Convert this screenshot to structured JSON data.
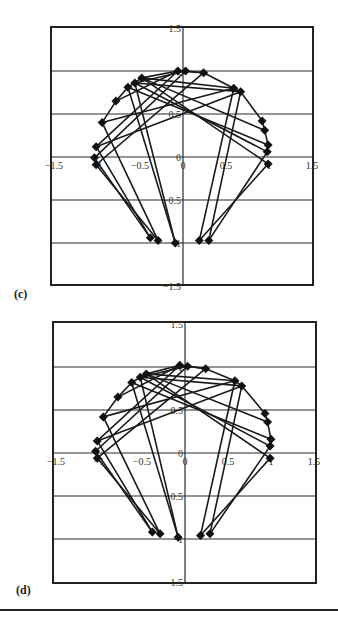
{
  "chart_data": [
    {
      "type": "scatter",
      "panel_label": "(c)",
      "title": "",
      "xlabel": "",
      "ylabel": "",
      "xlim": [
        -1.5,
        1.5
      ],
      "ylim": [
        -1.5,
        1.5
      ],
      "x_ticks": [
        "-1.5",
        "-1",
        "-0.5",
        "0",
        "0.5",
        "1",
        "1.5"
      ],
      "y_ticks": [
        "1.5",
        "1",
        "0.5",
        "0",
        "-0.5",
        "-1",
        "-1.5"
      ],
      "grid": "horizontal",
      "marker": "diamond",
      "line_color": "#1a1a1a",
      "nodes": [
        [
          -0.06,
          1.0
        ],
        [
          0.03,
          1.0
        ],
        [
          0.24,
          0.98
        ],
        [
          -0.48,
          0.92
        ],
        [
          -0.56,
          0.86
        ],
        [
          -0.64,
          0.81
        ],
        [
          -0.78,
          0.65
        ],
        [
          -0.94,
          0.4
        ],
        [
          -1.01,
          0.12
        ],
        [
          -1.03,
          -0.01
        ],
        [
          -1.01,
          -0.09
        ],
        [
          0.59,
          0.8
        ],
        [
          0.67,
          0.76
        ],
        [
          0.92,
          0.42
        ],
        [
          0.95,
          0.31
        ],
        [
          0.99,
          0.14
        ],
        [
          0.98,
          0.06
        ],
        [
          0.99,
          -0.08
        ],
        [
          -0.38,
          -0.94
        ],
        [
          -0.29,
          -0.97
        ],
        [
          -0.09,
          -1.0
        ],
        [
          0.19,
          -0.97
        ],
        [
          0.3,
          -0.97
        ]
      ],
      "edges": [
        [
          0,
          2
        ],
        [
          1,
          2
        ],
        [
          2,
          11
        ],
        [
          3,
          0
        ],
        [
          4,
          1
        ],
        [
          5,
          3
        ],
        [
          6,
          5
        ],
        [
          7,
          6
        ],
        [
          3,
          17
        ],
        [
          4,
          16
        ],
        [
          5,
          15
        ],
        [
          3,
          14
        ],
        [
          0,
          8
        ],
        [
          1,
          9
        ],
        [
          2,
          10
        ],
        [
          11,
          7
        ],
        [
          12,
          8
        ],
        [
          11,
          12
        ],
        [
          12,
          13
        ],
        [
          13,
          14
        ],
        [
          14,
          15
        ],
        [
          11,
          21
        ],
        [
          12,
          22
        ],
        [
          17,
          21
        ],
        [
          16,
          22
        ],
        [
          5,
          20
        ],
        [
          7,
          19
        ],
        [
          9,
          18
        ],
        [
          10,
          19
        ],
        [
          8,
          18
        ],
        [
          4,
          12
        ],
        [
          3,
          11
        ],
        [
          6,
          0
        ],
        [
          4,
          20
        ]
      ]
    },
    {
      "type": "scatter",
      "panel_label": "(d)",
      "title": "",
      "xlabel": "",
      "ylabel": "",
      "xlim": [
        -1.5,
        1.5
      ],
      "ylim": [
        -1.5,
        1.5
      ],
      "x_ticks": [
        "-1.5",
        "-1",
        "-0.5",
        "0",
        "0.5",
        "1",
        "1.5"
      ],
      "y_ticks": [
        "1.5",
        "1",
        "0.5",
        "0",
        "-0.5",
        "-1",
        "-1.5"
      ],
      "grid": "horizontal",
      "marker": "diamond",
      "line_color": "#1a1a1a",
      "nodes": [
        [
          -0.06,
          1.02
        ],
        [
          0.03,
          1.01
        ],
        [
          0.24,
          0.98
        ],
        [
          -0.45,
          0.92
        ],
        [
          -0.52,
          0.88
        ],
        [
          -0.62,
          0.82
        ],
        [
          -0.78,
          0.65
        ],
        [
          -0.95,
          0.42
        ],
        [
          -1.02,
          0.14
        ],
        [
          -1.04,
          0.02
        ],
        [
          -1.02,
          -0.06
        ],
        [
          0.58,
          0.84
        ],
        [
          0.66,
          0.78
        ],
        [
          0.93,
          0.46
        ],
        [
          0.96,
          0.36
        ],
        [
          1.0,
          0.16
        ],
        [
          0.99,
          0.08
        ],
        [
          0.99,
          -0.06
        ],
        [
          -0.38,
          -0.92
        ],
        [
          -0.29,
          -0.94
        ],
        [
          -0.08,
          -0.98
        ],
        [
          0.18,
          -0.96
        ],
        [
          0.29,
          -0.94
        ]
      ],
      "edges": [
        [
          0,
          2
        ],
        [
          1,
          2
        ],
        [
          2,
          11
        ],
        [
          3,
          0
        ],
        [
          4,
          1
        ],
        [
          5,
          3
        ],
        [
          6,
          5
        ],
        [
          7,
          6
        ],
        [
          3,
          17
        ],
        [
          4,
          16
        ],
        [
          5,
          15
        ],
        [
          3,
          14
        ],
        [
          0,
          8
        ],
        [
          1,
          9
        ],
        [
          2,
          10
        ],
        [
          11,
          7
        ],
        [
          12,
          8
        ],
        [
          11,
          12
        ],
        [
          12,
          13
        ],
        [
          13,
          14
        ],
        [
          14,
          15
        ],
        [
          11,
          21
        ],
        [
          12,
          22
        ],
        [
          17,
          21
        ],
        [
          16,
          22
        ],
        [
          5,
          20
        ],
        [
          7,
          19
        ],
        [
          9,
          18
        ],
        [
          10,
          19
        ],
        [
          8,
          18
        ],
        [
          4,
          12
        ],
        [
          3,
          11
        ],
        [
          6,
          0
        ],
        [
          4,
          20
        ]
      ]
    }
  ],
  "panels": [
    {
      "label": "(c)",
      "frame": {
        "left": 51,
        "top": 27,
        "right": 313,
        "bottom": 285
      },
      "origin": [
        183,
        157
      ],
      "scale": 86
    },
    {
      "label": "(d)",
      "frame": {
        "left": 53,
        "top": 322,
        "right": 316,
        "bottom": 583
      },
      "origin": [
        185,
        453
      ],
      "scale": 86
    }
  ]
}
